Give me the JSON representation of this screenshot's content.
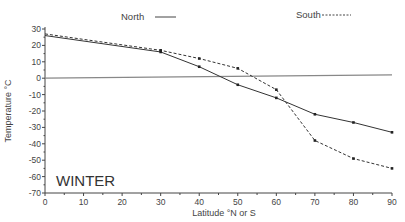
{
  "chart_data": {
    "type": "line",
    "title": "",
    "annotation": "WINTER",
    "xlabel": "Latitude °N or S",
    "ylabel": "Temperature °C",
    "xlim": [
      0,
      90
    ],
    "ylim": [
      -70,
      30
    ],
    "x_ticks": [
      0,
      10,
      20,
      30,
      40,
      50,
      60,
      70,
      80,
      90
    ],
    "y_ticks": [
      30,
      20,
      10,
      0,
      -10,
      -20,
      -30,
      -40,
      -50,
      -60,
      -70
    ],
    "x": [
      0,
      30,
      40,
      50,
      60,
      70,
      80,
      90
    ],
    "series": [
      {
        "name": "North",
        "style": "solid",
        "values": [
          26,
          16,
          7,
          -4,
          -12,
          -22,
          -27,
          -33
        ]
      },
      {
        "name": "South",
        "style": "dashed",
        "values": [
          27,
          17,
          12,
          6,
          -7,
          -38,
          -49,
          -55
        ]
      }
    ],
    "reference_line": {
      "style": "dotted-gray",
      "x": [
        0,
        90
      ],
      "y": [
        0,
        2
      ]
    },
    "grid": false,
    "legend_position": "top"
  },
  "legend": {
    "north": "North",
    "south": "South"
  },
  "labels": {
    "season": "WINTER",
    "xlabel": "Latitude °N or S",
    "ylabel": "Temperature °C"
  }
}
